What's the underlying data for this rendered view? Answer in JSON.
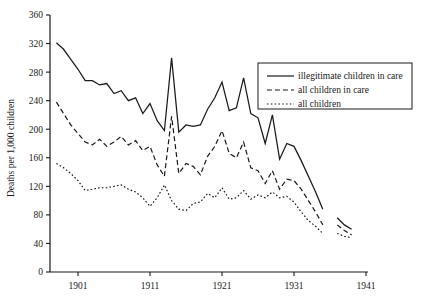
{
  "chart_data": {
    "type": "line",
    "title": "",
    "xlabel": "",
    "ylabel": "Deaths per 1,000 children",
    "xlim": [
      1897,
      1942
    ],
    "ylim": [
      0,
      360
    ],
    "grid": false,
    "legend_position": "top-right",
    "x_ticks": [
      1901,
      1911,
      1921,
      1931,
      1941
    ],
    "y_ticks": [
      0,
      40,
      80,
      120,
      160,
      200,
      240,
      280,
      320,
      360
    ],
    "series": [
      {
        "name": "illegitimate children in care",
        "style": "solid",
        "color": "#1a1a1a",
        "x": [
          1898,
          1899,
          1900,
          1901,
          1902,
          1903,
          1904,
          1905,
          1906,
          1907,
          1908,
          1909,
          1910,
          1911,
          1912,
          1913,
          1914,
          1915,
          1916,
          1917,
          1918,
          1919,
          1920,
          1921,
          1922,
          1923,
          1924,
          1925,
          1926,
          1927,
          1928,
          1929,
          1930,
          1931,
          1932,
          1933,
          1934,
          1935
        ],
        "y": [
          321,
          312,
          298,
          284,
          268,
          268,
          262,
          264,
          250,
          254,
          240,
          244,
          222,
          236,
          212,
          198,
          300,
          196,
          206,
          204,
          206,
          228,
          244,
          266,
          226,
          230,
          272,
          222,
          216,
          180,
          220,
          158,
          180,
          176,
          156,
          134,
          112,
          88
        ],
        "segments": [
          {
            "x": [
              1937,
              1938,
              1939
            ],
            "y": [
              76,
              66,
              60
            ]
          }
        ]
      },
      {
        "name": "all children in care",
        "style": "dashed",
        "color": "#1a1a1a",
        "x": [
          1898,
          1899,
          1900,
          1901,
          1902,
          1903,
          1904,
          1905,
          1906,
          1907,
          1908,
          1909,
          1910,
          1911,
          1912,
          1913,
          1914,
          1915,
          1916,
          1917,
          1918,
          1919,
          1920,
          1921,
          1922,
          1923,
          1924,
          1925,
          1926,
          1927,
          1928,
          1929,
          1930,
          1931,
          1932,
          1933,
          1934,
          1935
        ],
        "y": [
          238,
          222,
          206,
          194,
          182,
          178,
          186,
          176,
          182,
          190,
          178,
          184,
          170,
          176,
          150,
          134,
          218,
          138,
          152,
          148,
          136,
          162,
          176,
          198,
          166,
          160,
          182,
          146,
          142,
          124,
          142,
          116,
          130,
          128,
          116,
          100,
          84,
          66
        ],
        "segments": [
          {
            "x": [
              1937,
              1938,
              1939
            ],
            "y": [
              66,
              58,
              52
            ]
          }
        ]
      },
      {
        "name": "all children",
        "style": "dotted",
        "color": "#1a1a1a",
        "x": [
          1898,
          1899,
          1900,
          1901,
          1902,
          1903,
          1904,
          1905,
          1906,
          1907,
          1908,
          1909,
          1910,
          1911,
          1912,
          1913,
          1914,
          1915,
          1916,
          1917,
          1918,
          1919,
          1920,
          1921,
          1922,
          1923,
          1924,
          1925,
          1926,
          1927,
          1928,
          1929,
          1930,
          1931,
          1932,
          1933,
          1934,
          1935
        ],
        "y": [
          152,
          146,
          138,
          128,
          114,
          116,
          118,
          118,
          120,
          122,
          116,
          112,
          104,
          92,
          104,
          122,
          100,
          88,
          86,
          96,
          98,
          110,
          104,
          118,
          102,
          104,
          114,
          102,
          108,
          104,
          112,
          104,
          106,
          98,
          84,
          72,
          64,
          54
        ],
        "segments": [
          {
            "x": [
              1937,
              1938,
              1939
            ],
            "y": [
              54,
              50,
              48
            ]
          }
        ]
      }
    ]
  },
  "axis": {
    "y_title": "Deaths per 1,000 children",
    "y_tick_labels": [
      "0",
      "40",
      "80",
      "120",
      "160",
      "200",
      "240",
      "280",
      "320",
      "360"
    ],
    "x_tick_labels": [
      "1901",
      "1911",
      "1921",
      "1931",
      "1941"
    ]
  },
  "legend": {
    "items": [
      {
        "label": "illegitimate children in care",
        "style": "solid"
      },
      {
        "label": "all children in care",
        "style": "dashed"
      },
      {
        "label": "all children",
        "style": "dotted"
      }
    ]
  }
}
